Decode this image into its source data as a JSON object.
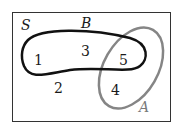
{
  "diagram": {
    "type": "venn",
    "universe_label": "S",
    "sets": [
      {
        "name": "B",
        "color": "#111111",
        "shape": "kidney"
      },
      {
        "name": "A",
        "color": "#808080",
        "shape": "tilted-ellipse"
      }
    ],
    "regions": [
      {
        "label": "1",
        "in": [
          "B"
        ]
      },
      {
        "label": "3",
        "in": [
          "B"
        ]
      },
      {
        "label": "5",
        "in": [
          "A",
          "B"
        ]
      },
      {
        "label": "4",
        "in": [
          "A"
        ]
      },
      {
        "label": "2",
        "in": []
      }
    ]
  },
  "labels": {
    "S": "S",
    "B": "B",
    "A": "A",
    "r1": "1",
    "r2": "2",
    "r3": "3",
    "r4": "4",
    "r5": "5"
  }
}
